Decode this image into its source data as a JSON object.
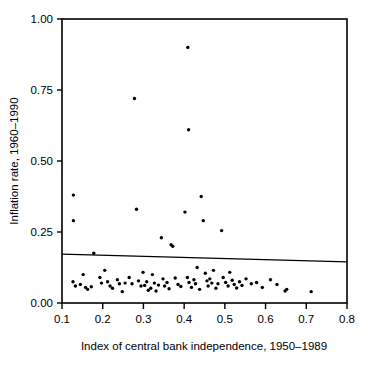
{
  "chart_data": {
    "type": "scatter",
    "title": "",
    "xlabel": "Index of central bank independence, 1950–1989",
    "ylabel": "Inflation rate, 1960–1990",
    "xlim": [
      0.1,
      0.8
    ],
    "ylim": [
      0.0,
      1.0
    ],
    "grid": false,
    "legend": null,
    "xticks": [
      0.1,
      0.2,
      0.3,
      0.4,
      0.5,
      0.6,
      0.7,
      0.8
    ],
    "xtick_labels": [
      "0.1",
      "0.2",
      "0.3",
      "0.4",
      "0.5",
      "0.6",
      "0.7",
      "0.8"
    ],
    "yticks": [
      0.0,
      0.25,
      0.5,
      0.75,
      1.0
    ],
    "ytick_labels": [
      "0.00",
      "0.25",
      "0.50",
      "0.75",
      "1.00"
    ],
    "marker": "dot",
    "marker_color": "#000000",
    "points": [
      [
        0.128,
        0.38
      ],
      [
        0.128,
        0.29
      ],
      [
        0.127,
        0.075
      ],
      [
        0.133,
        0.06
      ],
      [
        0.145,
        0.065
      ],
      [
        0.152,
        0.1
      ],
      [
        0.158,
        0.055
      ],
      [
        0.163,
        0.048
      ],
      [
        0.172,
        0.057
      ],
      [
        0.178,
        0.175
      ],
      [
        0.193,
        0.09
      ],
      [
        0.197,
        0.07
      ],
      [
        0.205,
        0.115
      ],
      [
        0.212,
        0.075
      ],
      [
        0.218,
        0.06
      ],
      [
        0.224,
        0.052
      ],
      [
        0.236,
        0.082
      ],
      [
        0.241,
        0.068
      ],
      [
        0.248,
        0.04
      ],
      [
        0.255,
        0.07
      ],
      [
        0.265,
        0.09
      ],
      [
        0.272,
        0.068
      ],
      [
        0.278,
        0.72
      ],
      [
        0.283,
        0.33
      ],
      [
        0.288,
        0.078
      ],
      [
        0.294,
        0.06
      ],
      [
        0.299,
        0.108
      ],
      [
        0.303,
        0.062
      ],
      [
        0.308,
        0.075
      ],
      [
        0.312,
        0.045
      ],
      [
        0.318,
        0.052
      ],
      [
        0.322,
        0.1
      ],
      [
        0.327,
        0.07
      ],
      [
        0.331,
        0.042
      ],
      [
        0.337,
        0.063
      ],
      [
        0.344,
        0.23
      ],
      [
        0.348,
        0.085
      ],
      [
        0.352,
        0.06
      ],
      [
        0.358,
        0.072
      ],
      [
        0.363,
        0.05
      ],
      [
        0.368,
        0.205
      ],
      [
        0.372,
        0.2
      ],
      [
        0.378,
        0.088
      ],
      [
        0.385,
        0.065
      ],
      [
        0.392,
        0.058
      ],
      [
        0.402,
        0.32
      ],
      [
        0.408,
        0.09
      ],
      [
        0.412,
        0.072
      ],
      [
        0.409,
        0.9
      ],
      [
        0.411,
        0.61
      ],
      [
        0.418,
        0.055
      ],
      [
        0.424,
        0.082
      ],
      [
        0.428,
        0.068
      ],
      [
        0.432,
        0.125
      ],
      [
        0.438,
        0.048
      ],
      [
        0.442,
        0.375
      ],
      [
        0.447,
        0.29
      ],
      [
        0.452,
        0.105
      ],
      [
        0.456,
        0.078
      ],
      [
        0.459,
        0.06
      ],
      [
        0.463,
        0.085
      ],
      [
        0.468,
        0.07
      ],
      [
        0.472,
        0.115
      ],
      [
        0.478,
        0.052
      ],
      [
        0.483,
        0.068
      ],
      [
        0.492,
        0.255
      ],
      [
        0.496,
        0.09
      ],
      [
        0.502,
        0.072
      ],
      [
        0.508,
        0.06
      ],
      [
        0.512,
        0.108
      ],
      [
        0.518,
        0.08
      ],
      [
        0.523,
        0.065
      ],
      [
        0.529,
        0.053
      ],
      [
        0.536,
        0.075
      ],
      [
        0.542,
        0.062
      ],
      [
        0.552,
        0.085
      ],
      [
        0.565,
        0.068
      ],
      [
        0.578,
        0.072
      ],
      [
        0.592,
        0.055
      ],
      [
        0.612,
        0.082
      ],
      [
        0.628,
        0.065
      ],
      [
        0.648,
        0.042
      ],
      [
        0.652,
        0.048
      ],
      [
        0.712,
        0.04
      ]
    ],
    "fit_line": {
      "type": "line",
      "x0": 0.1,
      "y0": 0.172,
      "x1": 0.8,
      "y1": 0.145,
      "color": "#000000"
    }
  }
}
